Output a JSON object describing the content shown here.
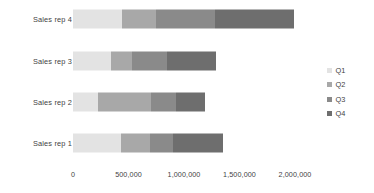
{
  "chart_data": {
    "type": "bar",
    "orientation": "horizontal",
    "stacked": true,
    "title": "",
    "xlabel": "",
    "ylabel": "",
    "categories": [
      "Sales rep 1",
      "Sales rep 2",
      "Sales rep 3",
      "Sales rep 4"
    ],
    "category_order_top_to_bottom": [
      "Sales rep 4",
      "Sales rep 3",
      "Sales rep 2",
      "Sales rep 1"
    ],
    "series": [
      {
        "name": "Q1",
        "color": "#e3e3e3",
        "values": [
          430000,
          228000,
          340000,
          440000
        ]
      },
      {
        "name": "Q2",
        "color": "#a8a8a8",
        "values": [
          264000,
          472000,
          195000,
          310000
        ]
      },
      {
        "name": "Q3",
        "color": "#8a8a8a",
        "values": [
          210000,
          228000,
          310000,
          530000
        ]
      },
      {
        "name": "Q4",
        "color": "#6e6e6e",
        "values": [
          450000,
          261000,
          440000,
          710000
        ]
      }
    ],
    "totals": [
      1354000,
      1189000,
      1285000,
      1990000
    ],
    "xlim": [
      0,
      2000000
    ],
    "xticks": [
      0,
      500000,
      1000000,
      1500000,
      2000000
    ],
    "xtick_labels": [
      "0",
      "500,000",
      "1,000,000",
      "1,500,000",
      "2,000,000"
    ],
    "grid": false,
    "legend_position": "right"
  },
  "legend": {
    "items": [
      {
        "label": "Q1",
        "color": "#e3e3e3"
      },
      {
        "label": "Q2",
        "color": "#a8a8a8"
      },
      {
        "label": "Q3",
        "color": "#8a8a8a"
      },
      {
        "label": "Q4",
        "color": "#6e6e6e"
      }
    ]
  },
  "colors": {
    "background": "#ffffff",
    "text": "#3f3f3f",
    "q1": "#e3e3e3",
    "q2": "#a8a8a8",
    "q3": "#8a8a8a",
    "q4": "#6e6e6e"
  }
}
